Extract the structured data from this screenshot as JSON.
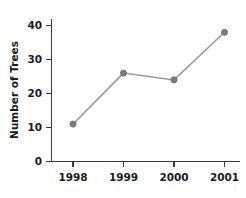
{
  "chart_data": {
    "type": "line",
    "title": "",
    "xlabel": "",
    "ylabel": "Number of Trees",
    "categories": [
      "1998",
      "1999",
      "2000",
      "2001"
    ],
    "values": [
      11,
      26,
      24,
      38
    ],
    "series": [
      {
        "name": "Number of Trees",
        "values": [
          11,
          26,
          24,
          38
        ]
      }
    ],
    "ylim": [
      0,
      42
    ],
    "yticks": [
      0,
      10,
      20,
      30,
      40
    ],
    "ytick_labels": [
      "0",
      "10",
      "20",
      "30",
      "40"
    ],
    "xtick_labels": [
      "1998",
      "1999",
      "2000",
      "2001"
    ],
    "grid": false,
    "legend": "none",
    "marker": "circle",
    "line_color": "#9a9a9a",
    "marker_color": "#7c7c7c",
    "axis_color": "#3a3a3a",
    "text_color": "#1b1b1b",
    "background_color": "#ffffff"
  },
  "axes": {
    "y_title": "Number of Trees",
    "y_tick_0": "0",
    "y_tick_1": "10",
    "y_tick_2": "20",
    "y_tick_3": "30",
    "y_tick_4": "40",
    "x_tick_0": "1998",
    "x_tick_1": "1999",
    "x_tick_2": "2000",
    "x_tick_3": "2001"
  }
}
